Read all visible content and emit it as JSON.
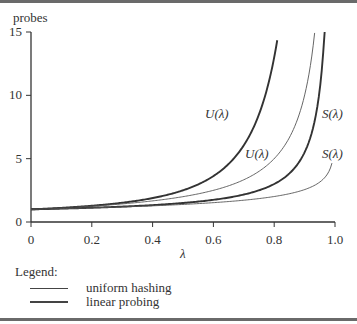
{
  "chart_data": {
    "type": "line",
    "title": "",
    "xlabel": "λ",
    "ylabel": "probes",
    "xlim": [
      0,
      1.0
    ],
    "ylim": [
      0,
      15
    ],
    "x_ticks": [
      "0",
      "0.2",
      "0.4",
      "0.6",
      "0.8",
      "1.0"
    ],
    "y_ticks": [
      "0",
      "5",
      "10",
      "15"
    ],
    "grid": false,
    "legend": {
      "title": "Legend:",
      "position": "bottom-left",
      "entries": [
        {
          "label": "uniform hashing",
          "style": "thin"
        },
        {
          "label": "linear probing",
          "style": "thick"
        }
      ]
    },
    "series": [
      {
        "name": "U(λ) linear probing",
        "method": "linear probing",
        "style": "thick",
        "x": [
          0,
          0.2,
          0.4,
          0.6,
          0.7,
          0.75,
          0.8,
          0.81
        ],
        "y": [
          1.0,
          1.28,
          1.89,
          3.63,
          6.06,
          8.5,
          13.0,
          14.35
        ]
      },
      {
        "name": "U(λ) uniform hashing",
        "method": "uniform hashing",
        "style": "thin",
        "x": [
          0,
          0.2,
          0.4,
          0.6,
          0.7,
          0.8,
          0.9,
          0.933
        ],
        "y": [
          1.0,
          1.25,
          1.67,
          2.5,
          3.33,
          5.0,
          10.0,
          14.9
        ]
      },
      {
        "name": "S(λ) linear probing",
        "method": "linear probing",
        "style": "thick",
        "x": [
          0,
          0.2,
          0.4,
          0.6,
          0.8,
          0.9,
          0.95,
          0.966
        ],
        "y": [
          1.0,
          1.13,
          1.33,
          1.75,
          3.0,
          5.5,
          10.5,
          15.0
        ]
      },
      {
        "name": "S(λ) uniform hashing",
        "method": "uniform hashing",
        "style": "thin",
        "x": [
          0.001,
          0.2,
          0.4,
          0.6,
          0.8,
          0.9,
          0.95,
          0.99
        ],
        "y": [
          1.0,
          1.12,
          1.28,
          1.53,
          2.01,
          2.56,
          3.15,
          4.65
        ]
      }
    ],
    "annotations": [
      {
        "text": "U(λ)",
        "near": "U(λ) linear probing"
      },
      {
        "text": "U(λ)",
        "near": "U(λ) uniform hashing"
      },
      {
        "text": "S(λ)",
        "near": "S(λ) linear probing"
      },
      {
        "text": "S(λ)",
        "near": "S(λ) uniform hashing"
      }
    ]
  },
  "labels": {
    "ylabel": "probes",
    "xlabel": "λ",
    "curve_U": "U(λ)",
    "curve_S": "S(λ)"
  },
  "legend": {
    "title": "Legend:",
    "uniform": "uniform hashing",
    "linear": "linear probing"
  }
}
